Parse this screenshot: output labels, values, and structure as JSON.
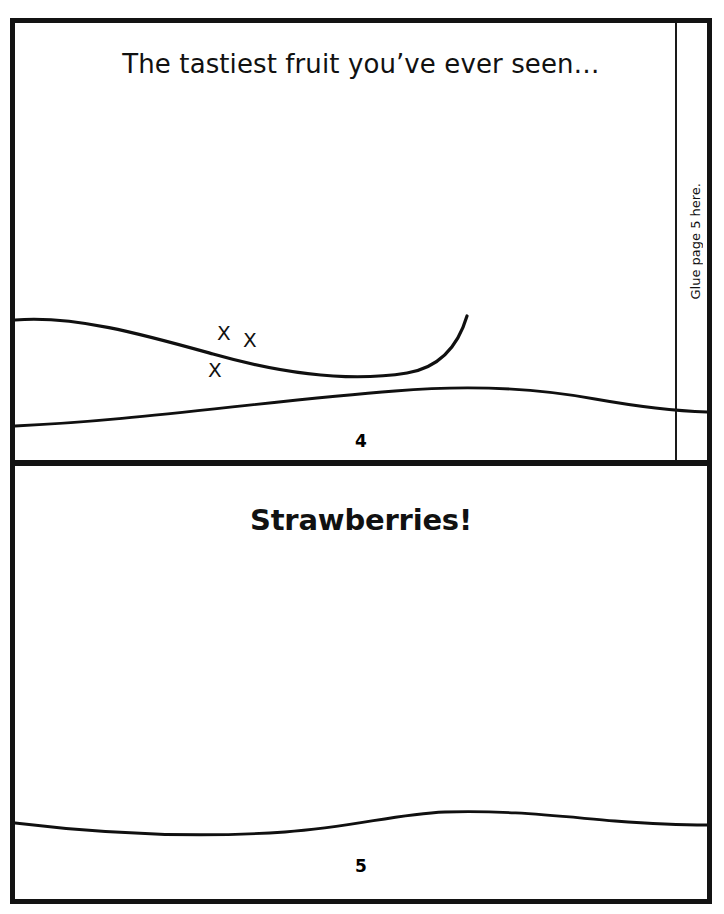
{
  "document": {
    "type": "printable-mini-book-page",
    "background_color": "#ffffff",
    "ink_color": "#111111",
    "frame_color": "#131313"
  },
  "cut_off_text": "",
  "page4": {
    "headline": "The tastiest fruit you’ve ever seen…",
    "page_number": "4",
    "x_marks": [
      "X",
      "X",
      "X"
    ],
    "glue_label": "Glue page 5 here."
  },
  "page5": {
    "headline": "Strawberries!",
    "page_number": "5"
  }
}
